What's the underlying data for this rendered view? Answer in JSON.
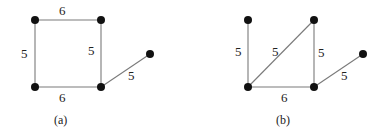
{
  "figures": [
    {
      "id": "a",
      "caption": "(a)",
      "nodes": [
        {
          "id": "a-tl",
          "x": 35,
          "y": 20
        },
        {
          "id": "a-tr",
          "x": 101,
          "y": 20
        },
        {
          "id": "a-bl",
          "x": 35,
          "y": 87
        },
        {
          "id": "a-br",
          "x": 101,
          "y": 87
        },
        {
          "id": "a-far",
          "x": 150,
          "y": 54
        }
      ],
      "edges": [
        {
          "from": "a-tl",
          "to": "a-tr",
          "weight": "6",
          "lx": 62,
          "ly": 14
        },
        {
          "from": "a-tl",
          "to": "a-bl",
          "weight": "5",
          "lx": 22,
          "ly": 58
        },
        {
          "from": "a-tr",
          "to": "a-br",
          "weight": "5",
          "lx": 88,
          "ly": 55
        },
        {
          "from": "a-bl",
          "to": "a-br",
          "weight": "6",
          "lx": 59,
          "ly": 102
        },
        {
          "from": "a-br",
          "to": "a-far",
          "weight": "5",
          "lx": 128,
          "ly": 80
        }
      ]
    },
    {
      "id": "b",
      "caption": "(b)",
      "nodes": [
        {
          "id": "b-tl",
          "x": 248,
          "y": 20
        },
        {
          "id": "b-tr",
          "x": 314,
          "y": 20
        },
        {
          "id": "b-bl",
          "x": 248,
          "y": 87
        },
        {
          "id": "b-br",
          "x": 314,
          "y": 87
        },
        {
          "id": "b-far",
          "x": 363,
          "y": 54
        }
      ],
      "edges": [
        {
          "from": "b-tl",
          "to": "b-bl",
          "weight": "5",
          "lx": 235,
          "ly": 56
        },
        {
          "from": "b-bl",
          "to": "b-tr",
          "weight": "5",
          "lx": 272,
          "ly": 56
        },
        {
          "from": "b-tr",
          "to": "b-br",
          "weight": "5",
          "lx": 318,
          "ly": 57
        },
        {
          "from": "b-bl",
          "to": "b-br",
          "weight": "6",
          "lx": 281,
          "ly": 102
        },
        {
          "from": "b-br",
          "to": "b-far",
          "weight": "5",
          "lx": 341,
          "ly": 80
        }
      ]
    }
  ],
  "captions": {
    "a": "(a)",
    "b": "(b)"
  },
  "labels": {
    "a_e0": "6",
    "a_e1": "5",
    "a_e2": "5",
    "a_e3": "6",
    "a_e4": "5",
    "b_e0": "5",
    "b_e1": "5",
    "b_e2": "5",
    "b_e3": "6",
    "b_e4": "5"
  }
}
